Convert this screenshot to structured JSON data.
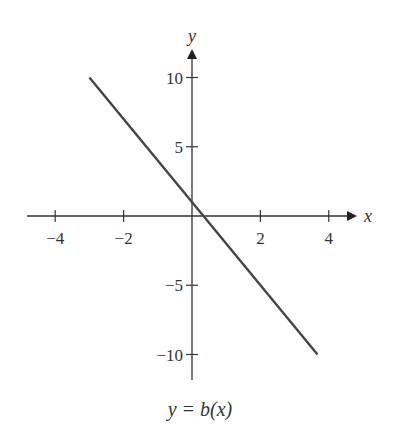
{
  "chart_data": {
    "type": "line",
    "title": "",
    "caption": "y = b(x)",
    "xlabel": "x",
    "ylabel": "y",
    "xlim": [
      -4.5,
      4.6
    ],
    "ylim": [
      -12,
      12
    ],
    "x_ticks": [
      -4,
      -2,
      2,
      4
    ],
    "x_tick_labels": [
      "−4",
      "−2",
      "2",
      "4"
    ],
    "y_ticks": [
      10,
      5,
      -5,
      -10
    ],
    "y_tick_labels": [
      "10",
      "5",
      "−5",
      "−10"
    ],
    "grid": false,
    "series": [
      {
        "name": "b(x)",
        "equation": "y = 1 - 3x",
        "x": [
          -3,
          3.67
        ],
        "y": [
          10,
          -10
        ],
        "color": "#444444"
      }
    ]
  }
}
